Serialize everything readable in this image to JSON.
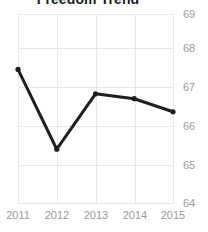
{
  "chart_data": {
    "type": "line",
    "title": "Freedom Trend",
    "xlabel": "",
    "ylabel": "",
    "categories": [
      "2011",
      "2012",
      "2013",
      "2014",
      "2015"
    ],
    "x": [
      2011,
      2012,
      2013,
      2014,
      2015
    ],
    "values": [
      67.75,
      65.3,
      67.0,
      66.85,
      66.45
    ],
    "series": [
      {
        "name": "Freedom Score",
        "values": [
          67.75,
          65.3,
          67.0,
          66.85,
          66.45
        ]
      }
    ],
    "ylim": [
      63.65,
      69.45
    ],
    "yticks": [
      69,
      68,
      67,
      66,
      65,
      64
    ],
    "ytick_labels": [
      "69",
      "68",
      "67",
      "66",
      "65",
      "64"
    ],
    "xtick_labels": [
      "2011",
      "2012",
      "2013",
      "2014",
      "2015"
    ],
    "y_axis_position": "right",
    "grid": true,
    "grid_axes": "both",
    "legend": false,
    "legend_position": "none",
    "markers": true,
    "colors": {
      "line": "#1f1f1f",
      "marker": "#1f1f1f",
      "grid": "#e8e8e8",
      "tick_label": "#9a9a9a",
      "title": "#1b1b1b",
      "background": "#ffffff"
    },
    "line_width": 3
  }
}
